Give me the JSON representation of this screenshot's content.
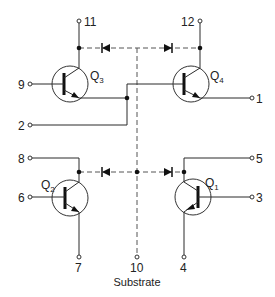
{
  "diagram": {
    "colors": {
      "line": "#2a2a2a",
      "background": "#ffffff"
    },
    "pins": [
      {
        "id": "pin-1",
        "label": "1"
      },
      {
        "id": "pin-2",
        "label": "2"
      },
      {
        "id": "pin-3",
        "label": "3"
      },
      {
        "id": "pin-4",
        "label": "4"
      },
      {
        "id": "pin-5",
        "label": "5"
      },
      {
        "id": "pin-6",
        "label": "6"
      },
      {
        "id": "pin-7",
        "label": "7"
      },
      {
        "id": "pin-8",
        "label": "8"
      },
      {
        "id": "pin-9",
        "label": "9"
      },
      {
        "id": "pin-10",
        "label": "10"
      },
      {
        "id": "pin-11",
        "label": "11"
      },
      {
        "id": "pin-12",
        "label": "12"
      }
    ],
    "transistors": [
      {
        "id": "Q1",
        "prefix": "Q",
        "sub": "1"
      },
      {
        "id": "Q2",
        "prefix": "Q",
        "sub": "2"
      },
      {
        "id": "Q3",
        "prefix": "Q",
        "sub": "3"
      },
      {
        "id": "Q4",
        "prefix": "Q",
        "sub": "4"
      }
    ],
    "substrate_label": "Substrate"
  }
}
